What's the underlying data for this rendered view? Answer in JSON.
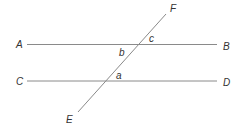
{
  "diagram": {
    "type": "parallel-lines-transversal",
    "lines": [
      {
        "id": "AB",
        "start_label": "A",
        "end_label": "B"
      },
      {
        "id": "CD",
        "start_label": "C",
        "end_label": "D"
      },
      {
        "id": "EF",
        "start_label": "E",
        "end_label": "F"
      }
    ],
    "angles": {
      "a": "a",
      "b": "b",
      "c": "c"
    },
    "points": {
      "A": "A",
      "B": "B",
      "C": "C",
      "D": "D",
      "E": "E",
      "F": "F"
    },
    "colors": {
      "line": "#8a8a8a",
      "text": "#333333"
    }
  }
}
